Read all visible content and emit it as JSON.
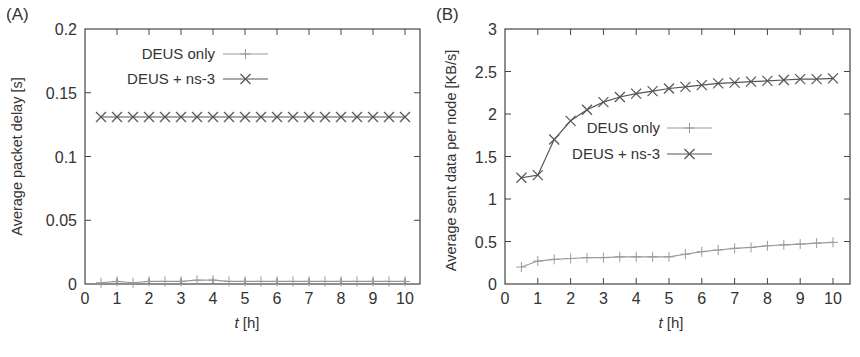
{
  "chart_data": [
    {
      "panel_label": "(A)",
      "type": "line",
      "title": "",
      "xlabel_italic": "t",
      "xlabel_rest": " [h]",
      "ylabel": "Average packet delay [s]",
      "xlim": [
        0,
        10
      ],
      "ylim": [
        0,
        0.2
      ],
      "xticks": [
        0,
        1,
        2,
        3,
        4,
        5,
        6,
        7,
        8,
        9,
        10
      ],
      "yticks": [
        0,
        0.05,
        0.1,
        0.15,
        0.2
      ],
      "ytick_labels": [
        "0",
        "0.05",
        "0.1",
        "0.15",
        "0.2"
      ],
      "grid": false,
      "legend_position": "top-left",
      "x": [
        0.5,
        1,
        1.5,
        2,
        2.5,
        3,
        3.5,
        4,
        4.5,
        5,
        5.5,
        6,
        6.5,
        7,
        7.5,
        8,
        8.5,
        9,
        9.5,
        10
      ],
      "series": [
        {
          "name": "DEUS only",
          "marker": "plus",
          "color": "#9a9a9a",
          "values": [
            0.001,
            0.002,
            0.001,
            0.002,
            0.002,
            0.002,
            0.003,
            0.003,
            0.002,
            0.002,
            0.002,
            0.002,
            0.002,
            0.002,
            0.002,
            0.002,
            0.002,
            0.002,
            0.002,
            0.002
          ]
        },
        {
          "name": "DEUS + ns-3",
          "marker": "cross",
          "color": "#555555",
          "values": [
            0.131,
            0.131,
            0.131,
            0.131,
            0.131,
            0.131,
            0.131,
            0.131,
            0.131,
            0.131,
            0.131,
            0.131,
            0.131,
            0.131,
            0.131,
            0.131,
            0.131,
            0.131,
            0.131,
            0.131
          ]
        }
      ]
    },
    {
      "panel_label": "(B)",
      "type": "line",
      "title": "",
      "xlabel_italic": "t",
      "xlabel_rest": " [h]",
      "ylabel": "Average sent data per node [KB/s]",
      "xlim": [
        0,
        10
      ],
      "ylim": [
        0,
        3
      ],
      "xticks": [
        0,
        1,
        2,
        3,
        4,
        5,
        6,
        7,
        8,
        9,
        10
      ],
      "yticks": [
        0,
        0.5,
        1,
        1.5,
        2,
        2.5,
        3
      ],
      "ytick_labels": [
        "0",
        "0.5",
        "1",
        "1.5",
        "2",
        "2.5",
        "3"
      ],
      "grid": false,
      "legend_position": "center",
      "x": [
        0.5,
        1,
        1.5,
        2,
        2.5,
        3,
        3.5,
        4,
        4.5,
        5,
        5.5,
        6,
        6.5,
        7,
        7.5,
        8,
        8.5,
        9,
        9.5,
        10
      ],
      "series": [
        {
          "name": "DEUS only",
          "marker": "plus",
          "color": "#9a9a9a",
          "values": [
            0.2,
            0.27,
            0.29,
            0.3,
            0.31,
            0.31,
            0.32,
            0.32,
            0.32,
            0.32,
            0.35,
            0.38,
            0.4,
            0.42,
            0.43,
            0.45,
            0.46,
            0.47,
            0.48,
            0.49
          ]
        },
        {
          "name": "DEUS + ns-3",
          "marker": "cross",
          "color": "#555555",
          "values": [
            1.25,
            1.28,
            1.7,
            1.92,
            2.05,
            2.14,
            2.2,
            2.24,
            2.27,
            2.3,
            2.32,
            2.34,
            2.36,
            2.37,
            2.38,
            2.39,
            2.4,
            2.41,
            2.41,
            2.42
          ]
        }
      ]
    }
  ],
  "panels_layout": [
    {
      "left": 85,
      "right": 420,
      "top": 29,
      "bottom": 284,
      "x10": 405,
      "legend": {
        "text_right_x": 215,
        "line_x1": 223,
        "line_x2": 268,
        "row1_y": 54,
        "row2_y": 79
      }
    },
    {
      "left": 505,
      "right": 850,
      "top": 29,
      "bottom": 284,
      "x10": 833,
      "legend": {
        "text_right_x": 660,
        "line_x1": 667,
        "line_x2": 712,
        "row1_y": 128,
        "row2_y": 154
      }
    }
  ]
}
